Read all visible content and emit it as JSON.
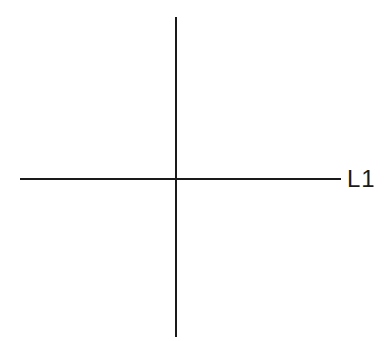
{
  "diagram": {
    "type": "crossed-lines",
    "lines": [
      {
        "id": "vertical",
        "orientation": "vertical",
        "label": ""
      },
      {
        "id": "horizontal",
        "orientation": "horizontal",
        "label": "L1"
      }
    ],
    "labels": {
      "horizontal_line": "L1"
    },
    "colors": {
      "stroke": "#1a1a1a",
      "background": "#ffffff"
    }
  }
}
